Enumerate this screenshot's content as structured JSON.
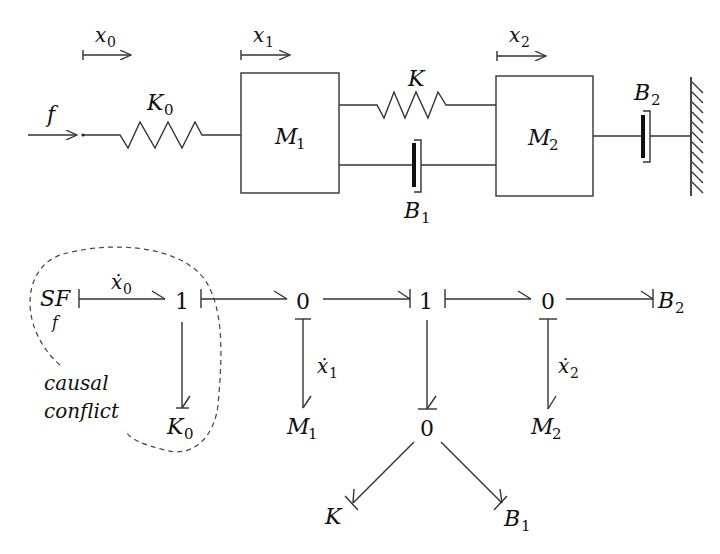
{
  "mechanical": {
    "force_label": "f",
    "displacements": [
      {
        "label": "x",
        "sub": "0"
      },
      {
        "label": "x",
        "sub": "1"
      },
      {
        "label": "x",
        "sub": "2"
      }
    ],
    "spring_k0": {
      "label": "K",
      "sub": "0"
    },
    "spring_k": {
      "label": "K",
      "sub": ""
    },
    "mass1": {
      "label": "M",
      "sub": "1"
    },
    "mass2": {
      "label": "M",
      "sub": "2"
    },
    "damper_b1": {
      "label": "B",
      "sub": "1"
    },
    "damper_b2": {
      "label": "B",
      "sub": "2"
    },
    "wall": "fixed-wall"
  },
  "bond_graph": {
    "source": {
      "label": "SF",
      "sub": "f"
    },
    "junctions": [
      {
        "id": "j1a",
        "label": "1"
      },
      {
        "id": "j0a",
        "label": "0"
      },
      {
        "id": "j1b",
        "label": "1"
      },
      {
        "id": "j0b",
        "label": "0"
      },
      {
        "id": "j0c",
        "label": "0"
      }
    ],
    "elements": {
      "k0": {
        "label": "K",
        "sub": "0"
      },
      "m1": {
        "label": "M",
        "sub": "1"
      },
      "m2": {
        "label": "M",
        "sub": "2"
      },
      "k": {
        "label": "K",
        "sub": ""
      },
      "b1": {
        "label": "B",
        "sub": "1"
      },
      "b2": {
        "label": "B",
        "sub": "2"
      }
    },
    "flow_labels": [
      {
        "label": "ẋ",
        "sub": "0"
      },
      {
        "label": "ẋ",
        "sub": "1"
      },
      {
        "label": "ẋ",
        "sub": "2"
      }
    ],
    "annotation": {
      "line1": "causal",
      "line2": "conflict"
    }
  }
}
